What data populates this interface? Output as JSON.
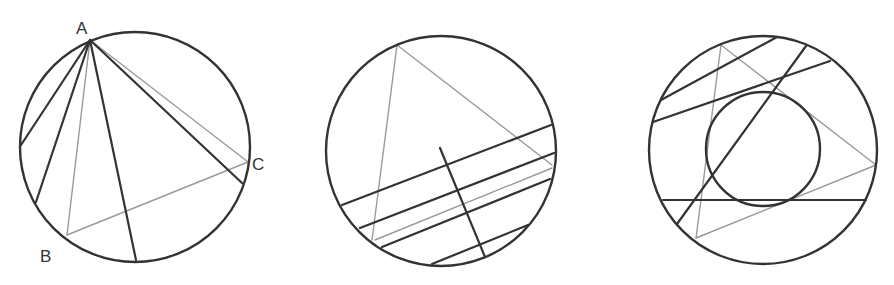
{
  "colors": {
    "dark": "#333333",
    "gray": "#9a9a9a",
    "background": "#ffffff"
  },
  "figures": [
    {
      "id": "figure-1",
      "description": "Circumscribed circle with triangle ABC and chords from A",
      "circle": {
        "cx": 135,
        "cy": 147,
        "r": 115
      },
      "labels": [
        {
          "text": "A",
          "x": 76,
          "y": 34
        },
        {
          "text": "B",
          "x": 40,
          "y": 262
        },
        {
          "text": "C",
          "x": 252,
          "y": 170
        }
      ],
      "points": {
        "A": [
          90,
          40
        ],
        "B": [
          67,
          235
        ],
        "C": [
          248,
          162
        ]
      },
      "gray_segments": [
        [
          90,
          40,
          67,
          235
        ],
        [
          90,
          40,
          248,
          162
        ],
        [
          67,
          235,
          248,
          162
        ]
      ],
      "dark_segments": [
        [
          90,
          40,
          21,
          145
        ],
        [
          90,
          40,
          36,
          202
        ],
        [
          90,
          40,
          136,
          260
        ],
        [
          90,
          40,
          242,
          183
        ]
      ]
    },
    {
      "id": "figure-2",
      "description": "Circle with inscribed triangle sides and family of parallel chords with a perpendicular segment",
      "circle": {
        "cx": 441,
        "cy": 151,
        "r": 115
      },
      "gray_segments": [
        [
          397,
          45,
          372,
          240
        ],
        [
          397,
          45,
          552,
          165
        ],
        [
          375,
          240,
          552,
          168
        ]
      ],
      "dark_segments": [
        [
          342,
          205,
          551,
          125
        ],
        [
          360,
          228,
          554,
          153
        ],
        [
          382,
          247,
          550,
          179
        ],
        [
          432,
          264,
          528,
          225
        ],
        [
          440,
          148,
          485,
          257
        ]
      ]
    },
    {
      "id": "figure-3",
      "description": "Circle with incircle, gray triangle, and dark chords tangent to inner circle",
      "circle": {
        "cx": 763,
        "cy": 150,
        "r": 114
      },
      "inner_circle": {
        "cx": 763,
        "cy": 149,
        "r": 57
      },
      "gray_segments": [
        [
          721,
          45,
          876,
          165
        ],
        [
          876,
          165,
          696,
          238
        ],
        [
          696,
          238,
          721,
          45
        ]
      ],
      "dark_segments": [
        [
          661,
          100,
          777,
          37
        ],
        [
          653,
          122,
          830,
          61
        ],
        [
          677,
          224,
          806,
          46
        ],
        [
          663,
          200,
          866,
          200
        ]
      ]
    }
  ]
}
